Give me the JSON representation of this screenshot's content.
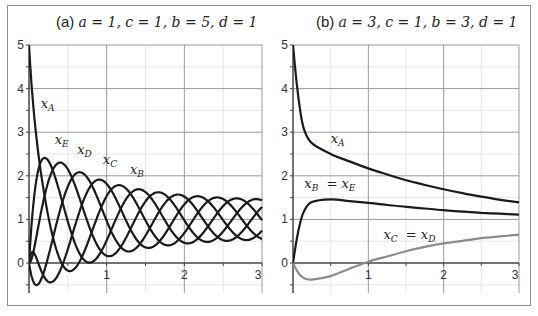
{
  "panels": [
    {
      "id": "a",
      "title": "(a) a = 1,  c = 1,  b = 5,  d = 1",
      "title_prefix": "(a)",
      "params": "a = 1,  c = 1,  b = 5,  d = 1"
    },
    {
      "id": "b",
      "title": "(b) a = 3, c = 1,  b = 3,  d = 1",
      "title_prefix": "(b)",
      "params": "a = 3, c = 1,  b = 3,  d = 1"
    }
  ],
  "chart_data": [
    {
      "type": "line",
      "title": "(a) a = 1, c = 1, b = 5, d = 1",
      "xlabel": "",
      "ylabel": "",
      "xlim": [
        0,
        3
      ],
      "ylim": [
        -0.7,
        5
      ],
      "xticks": [
        1,
        2,
        3
      ],
      "yticks": [
        0,
        1,
        2,
        3,
        4,
        5
      ],
      "grid": true,
      "legend": "inline labels",
      "x": [
        0,
        0.25,
        0.5,
        0.75,
        1.0,
        1.25,
        1.5,
        1.75,
        2.0,
        2.25,
        2.5,
        2.75,
        3.0
      ],
      "series": [
        {
          "name": "x_A",
          "label_main": "x",
          "label_sub": "A",
          "color": "#1a1a1a",
          "phase": 1.18,
          "initial": 5,
          "values": [
            5,
            0.94,
            -0.18,
            0.43,
            1.54,
            1.7,
            0.97,
            0.41,
            0.69,
            1.32,
            1.47,
            0.98,
            0.56
          ]
        },
        {
          "name": "x_E",
          "label_main": "x",
          "label_sub": "E",
          "color": "#1a1a1a",
          "phase": 0.18,
          "initial": 0,
          "values": [
            0,
            2.41,
            0.95,
            0.02,
            0.52,
            1.46,
            1.63,
            0.98,
            0.46,
            0.71,
            1.31,
            1.45,
            0.98
          ]
        },
        {
          "name": "x_D",
          "label_main": "x",
          "label_sub": "D",
          "color": "#1a1a1a",
          "phase": 0.43,
          "initial": 0,
          "values": [
            0,
            1.93,
            2.15,
            0.96,
            0.16,
            0.58,
            1.41,
            1.57,
            0.98,
            0.5,
            0.72,
            1.3,
            1.43
          ]
        },
        {
          "name": "x_C",
          "label_main": "x",
          "label_sub": "C",
          "color": "#1a1a1a",
          "phase": 0.68,
          "initial": 0,
          "values": [
            0,
            0.17,
            1.76,
            1.96,
            0.97,
            0.28,
            0.63,
            1.38,
            1.53,
            0.98,
            0.52,
            0.73,
            1.28
          ]
        },
        {
          "name": "x_B",
          "label_main": "x",
          "label_sub": "B",
          "color": "#1a1a1a",
          "phase": 0.93,
          "initial": 0,
          "values": [
            0,
            -0.44,
            0.32,
            1.63,
            1.82,
            0.97,
            0.36,
            0.66,
            1.35,
            1.49,
            0.98,
            0.54,
            0.74
          ]
        }
      ],
      "model": {
        "center": 1,
        "period": 1.25,
        "amp_base": 0.42,
        "amp_decay": 1.45,
        "decay_tau": 0.85
      },
      "annotations": [
        {
          "text": "x_A",
          "x": 0.15,
          "y": 3.55
        },
        {
          "text": "x_E",
          "x": 0.33,
          "y": 2.73
        },
        {
          "text": "x_D",
          "x": 0.62,
          "y": 2.5
        },
        {
          "text": "x_C",
          "x": 0.95,
          "y": 2.28
        },
        {
          "text": "x_B",
          "x": 1.3,
          "y": 2.05
        }
      ]
    },
    {
      "type": "line",
      "title": "(b) a = 3, c = 1, b = 3, d = 1",
      "xlabel": "",
      "ylabel": "",
      "xlim": [
        0,
        3
      ],
      "ylim": [
        -0.7,
        5
      ],
      "xticks": [
        1,
        2,
        3
      ],
      "yticks": [
        0,
        1,
        2,
        3,
        4,
        5
      ],
      "grid": true,
      "legend": "inline labels",
      "x": [
        0,
        0.05,
        0.1,
        0.15,
        0.25,
        0.5,
        0.75,
        1.0,
        1.25,
        1.5,
        1.75,
        2.0,
        2.25,
        2.5,
        2.75,
        3.0
      ],
      "series": [
        {
          "name": "x_A",
          "label_main": "x",
          "label_sub": "A",
          "color": "#1a1a1a",
          "values": [
            5,
            4.1,
            3.45,
            3.05,
            2.75,
            2.5,
            2.33,
            2.17,
            2.03,
            1.9,
            1.79,
            1.69,
            1.6,
            1.52,
            1.45,
            1.39
          ]
        },
        {
          "name": "x_B = x_E",
          "label_main": "x",
          "label_sub": "B",
          "label_eq_sub": "E",
          "color": "#1a1a1a",
          "values": [
            0,
            0.55,
            0.95,
            1.2,
            1.4,
            1.46,
            1.42,
            1.38,
            1.33,
            1.29,
            1.25,
            1.21,
            1.18,
            1.15,
            1.13,
            1.11
          ]
        },
        {
          "name": "x_C = x_D",
          "label_main": "x",
          "label_sub": "C",
          "label_eq_sub": "D",
          "color": "#8c8c8c",
          "values": [
            0,
            -0.17,
            -0.29,
            -0.35,
            -0.38,
            -0.3,
            -0.13,
            0.03,
            0.15,
            0.27,
            0.37,
            0.45,
            0.51,
            0.57,
            0.61,
            0.65
          ]
        }
      ],
      "annotations": [
        {
          "text": "x_A",
          "x": 0.5,
          "y": 2.75
        },
        {
          "text": "x_B = x_E",
          "x": 0.15,
          "y": 1.72
        },
        {
          "text": "x_C = x_D",
          "x": 1.2,
          "y": 0.55
        }
      ]
    }
  ],
  "axes": {
    "tick_labels_y": [
      "0",
      "1",
      "2",
      "3",
      "4",
      "5"
    ],
    "tick_labels_x": [
      "1",
      "2",
      "3"
    ]
  },
  "colors": {
    "curve": "#1a1a1a",
    "curve_gray": "#8c8c8c",
    "grid_major": "#9a9a9a",
    "grid_minor": "#e6e6e6",
    "frame": "#8a8a8a"
  }
}
